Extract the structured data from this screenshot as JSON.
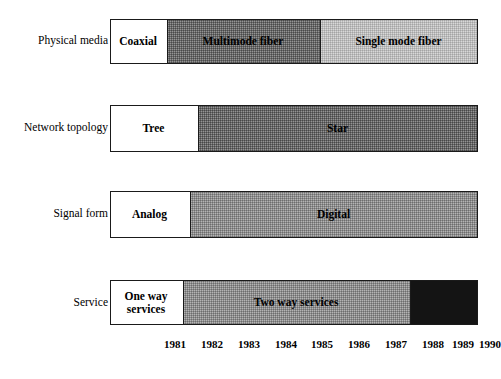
{
  "figure": {
    "title": "",
    "track": {
      "x0": 110,
      "x1": 478,
      "year_start": 1980.5,
      "year_end": 1990.5
    }
  },
  "rows": [
    {
      "label": "Physical media",
      "label_y": 35,
      "bar_y": 19,
      "bar_h": 45,
      "segments": [
        {
          "name": "Coaxial",
          "fill": "fill-white",
          "x0": 110,
          "x1": 167
        },
        {
          "name": "Multimode fiber",
          "fill": "fill-dark",
          "x0": 167,
          "x1": 320
        },
        {
          "name": "Single mode fiber",
          "fill": "fill-light",
          "x0": 320,
          "x1": 478
        }
      ]
    },
    {
      "label": "Network topology",
      "label_y": 122,
      "bar_y": 105,
      "bar_h": 47,
      "segments": [
        {
          "name": "Tree",
          "fill": "fill-white",
          "x0": 110,
          "x1": 198
        },
        {
          "name": "Star",
          "fill": "fill-dark",
          "x0": 198,
          "x1": 478
        }
      ]
    },
    {
      "label": "Signal form",
      "label_y": 208,
      "bar_y": 191,
      "bar_h": 47,
      "segments": [
        {
          "name": "Analog",
          "fill": "fill-white",
          "x0": 110,
          "x1": 190
        },
        {
          "name": "Digital",
          "fill": "fill-mid",
          "x0": 190,
          "x1": 478
        }
      ]
    },
    {
      "label": "Service",
      "label_y": 297,
      "bar_y": 280,
      "bar_h": 45,
      "segments": [
        {
          "name": "One way\nservices",
          "fill": "fill-white",
          "x0": 110,
          "x1": 183
        },
        {
          "name": "Two way services",
          "fill": "fill-mid",
          "x0": 183,
          "x1": 410
        },
        {
          "name": "",
          "fill": "fill-black",
          "x0": 410,
          "x1": 478
        }
      ]
    }
  ],
  "years": [
    {
      "text": "1981",
      "x": 175
    },
    {
      "text": "1982",
      "x": 212
    },
    {
      "text": "1983",
      "x": 249
    },
    {
      "text": "1984",
      "x": 286
    },
    {
      "text": "1985",
      "x": 322
    },
    {
      "text": "1986",
      "x": 359
    },
    {
      "text": "1987",
      "x": 396
    },
    {
      "text": "1988",
      "x": 433
    },
    {
      "text": "1989",
      "x": 463
    },
    {
      "text": "1990",
      "x": 490
    }
  ],
  "chart_data": {
    "type": "bar",
    "title": "",
    "xlabel": "",
    "ylabel": "",
    "xlim": [
      1980.5,
      1990.5
    ],
    "grid": false,
    "legend": "none",
    "orientation": "horizontal-timeline",
    "categories": [
      "Physical media",
      "Network topology",
      "Signal form",
      "Service"
    ],
    "tick_labels": [
      "1981",
      "1982",
      "1983",
      "1984",
      "1985",
      "1986",
      "1987",
      "1988",
      "1989",
      "1990"
    ],
    "series": [
      {
        "name": "Physical media",
        "spans": [
          {
            "label": "Coaxial",
            "start": 1980.5,
            "end": 1982.1,
            "shade": "white"
          },
          {
            "label": "Multimode fiber",
            "start": 1982.1,
            "end": 1986.2,
            "shade": "dark-gray"
          },
          {
            "label": "Single mode fiber",
            "start": 1986.2,
            "end": 1990.5,
            "shade": "light-gray"
          }
        ]
      },
      {
        "name": "Network topology",
        "spans": [
          {
            "label": "Tree",
            "start": 1980.5,
            "end": 1982.9,
            "shade": "white"
          },
          {
            "label": "Star",
            "start": 1982.9,
            "end": 1990.5,
            "shade": "dark-gray"
          }
        ]
      },
      {
        "name": "Signal form",
        "spans": [
          {
            "label": "Analog",
            "start": 1980.5,
            "end": 1982.7,
            "shade": "white"
          },
          {
            "label": "Digital",
            "start": 1982.7,
            "end": 1990.5,
            "shade": "mid-gray"
          }
        ]
      },
      {
        "name": "Service",
        "spans": [
          {
            "label": "One way services",
            "start": 1980.5,
            "end": 1982.5,
            "shade": "white"
          },
          {
            "label": "Two way services",
            "start": 1982.5,
            "end": 1988.6,
            "shade": "mid-gray"
          },
          {
            "label": "",
            "start": 1988.6,
            "end": 1990.5,
            "shade": "black"
          }
        ]
      }
    ]
  }
}
